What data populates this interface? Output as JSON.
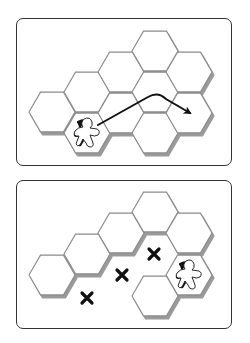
{
  "colors": {
    "hex_fill": "#ffffff",
    "hex_stroke": "#8a8a8a",
    "hex_shadow": "#9a9a9a",
    "ink": "#111111",
    "panel_border": "#333333"
  },
  "hex_geometry": {
    "orientation": "flat-top",
    "radius": 23,
    "col_spacing": 34.5,
    "row_half": 20.7
  },
  "panels": [
    {
      "id": "top",
      "description": "Meeple moves across tiles along curved arrow",
      "hexes": [
        {
          "x": 52,
          "y": 112
        },
        {
          "x": 87,
          "y": 92
        },
        {
          "x": 87,
          "y": 133,
          "meeple": true
        },
        {
          "x": 121,
          "y": 72
        },
        {
          "x": 121,
          "y": 113
        },
        {
          "x": 155,
          "y": 51
        },
        {
          "x": 155,
          "y": 92
        },
        {
          "x": 155,
          "y": 133
        },
        {
          "x": 189,
          "y": 72
        },
        {
          "x": 189,
          "y": 113
        }
      ],
      "arrow": {
        "path": "M 98 125 L 148 97 Q 158 91 166 99 L 190 113",
        "from": "meeple",
        "to": "right hex"
      },
      "icons": [
        "meeple-icon",
        "arrow-icon"
      ]
    },
    {
      "id": "bottom",
      "description": "Meeple cannot cross empty spaces (marked X)",
      "hexes": [
        {
          "x": 52,
          "y": 275
        },
        {
          "x": 87,
          "y": 254
        },
        {
          "x": 121,
          "y": 233
        },
        {
          "x": 155,
          "y": 212
        },
        {
          "x": 189,
          "y": 233
        },
        {
          "x": 189,
          "y": 275,
          "meeple": true
        },
        {
          "x": 155,
          "y": 296
        }
      ],
      "x_marks": [
        {
          "x": 87,
          "y": 298
        },
        {
          "x": 122,
          "y": 275
        },
        {
          "x": 154,
          "y": 254
        }
      ],
      "icons": [
        "meeple-icon",
        "x-mark-icon"
      ]
    }
  ]
}
